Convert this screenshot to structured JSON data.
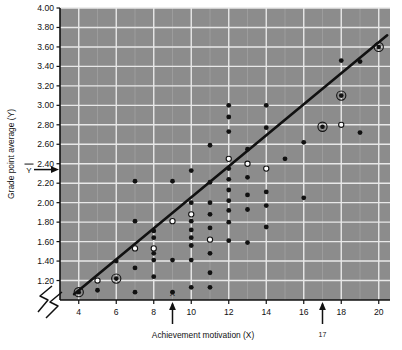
{
  "figure": {
    "plot_bg_color": "#8c8c8c",
    "grid_color": "#e8e8e8",
    "point_color": "#111111",
    "line_color": "#111111",
    "axis_color": "#111111"
  },
  "chart_data": {
    "type": "scatter",
    "title": "",
    "xlabel": "Achievement motivation (X)",
    "ylabel": "Grade point average (Y)",
    "xlim": [
      3,
      20.6
    ],
    "ylim": [
      1.0,
      4.0
    ],
    "grid": true,
    "legend": "none",
    "x_ticks": [
      4,
      6,
      8,
      10,
      12,
      14,
      16,
      18,
      20
    ],
    "x_tick_labels": [
      "4",
      "6",
      "8",
      "10",
      "12",
      "14",
      "16",
      "18",
      "20"
    ],
    "y_ticks": [
      1.2,
      1.4,
      1.6,
      1.8,
      2.0,
      2.2,
      2.4,
      2.6,
      2.8,
      3.0,
      3.2,
      3.4,
      3.6,
      3.8,
      4.0
    ],
    "y_tick_labels": [
      "1.20",
      "1.40",
      "1.60",
      "1.80",
      "2.00",
      "2.20",
      "2.40",
      "2.60",
      "2.80",
      "3.00",
      "3.20",
      "3.40",
      "3.60",
      "3.80",
      "4.00"
    ],
    "annotations": {
      "x_mean_label": "X",
      "x_mean_value": 9,
      "y_mean_label": "Y",
      "y_mean_value": 2.34,
      "extra_tick_label": "17",
      "extra_tick_value": 17,
      "axis_break": "zigzag"
    },
    "regression_line": {
      "x_start": 3.75,
      "y_start": 1.06,
      "x_end": 20.45,
      "y_end": 3.72
    },
    "points": [
      {
        "x": 4.0,
        "y": 1.08,
        "marker": "circled"
      },
      {
        "x": 5.0,
        "y": 1.1,
        "marker": "filled"
      },
      {
        "x": 5.0,
        "y": 1.2,
        "marker": "open"
      },
      {
        "x": 6.0,
        "y": 1.22,
        "marker": "circled"
      },
      {
        "x": 6.0,
        "y": 1.4,
        "marker": "filled"
      },
      {
        "x": 7.0,
        "y": 1.08,
        "marker": "filled"
      },
      {
        "x": 7.0,
        "y": 1.33,
        "marker": "filled"
      },
      {
        "x": 7.0,
        "y": 1.53,
        "marker": "open"
      },
      {
        "x": 7.0,
        "y": 1.81,
        "marker": "filled"
      },
      {
        "x": 7.0,
        "y": 2.22,
        "marker": "filled"
      },
      {
        "x": 8.0,
        "y": 1.24,
        "marker": "filled"
      },
      {
        "x": 8.0,
        "y": 1.41,
        "marker": "filled"
      },
      {
        "x": 8.0,
        "y": 1.48,
        "marker": "filled"
      },
      {
        "x": 8.0,
        "y": 1.53,
        "marker": "open"
      },
      {
        "x": 8.0,
        "y": 1.64,
        "marker": "filled"
      },
      {
        "x": 8.0,
        "y": 1.71,
        "marker": "filled"
      },
      {
        "x": 9.0,
        "y": 1.08,
        "marker": "filled"
      },
      {
        "x": 9.0,
        "y": 1.41,
        "marker": "filled"
      },
      {
        "x": 9.0,
        "y": 1.81,
        "marker": "open"
      },
      {
        "x": 9.0,
        "y": 2.22,
        "marker": "filled"
      },
      {
        "x": 10.0,
        "y": 1.13,
        "marker": "filled"
      },
      {
        "x": 10.0,
        "y": 1.41,
        "marker": "filled"
      },
      {
        "x": 10.0,
        "y": 1.56,
        "marker": "filled"
      },
      {
        "x": 10.0,
        "y": 1.64,
        "marker": "filled"
      },
      {
        "x": 10.0,
        "y": 1.72,
        "marker": "filled"
      },
      {
        "x": 10.0,
        "y": 1.81,
        "marker": "filled"
      },
      {
        "x": 10.0,
        "y": 1.88,
        "marker": "open"
      },
      {
        "x": 10.0,
        "y": 2.0,
        "marker": "filled"
      },
      {
        "x": 10.0,
        "y": 2.33,
        "marker": "filled"
      },
      {
        "x": 11.0,
        "y": 1.13,
        "marker": "filled"
      },
      {
        "x": 11.0,
        "y": 1.28,
        "marker": "filled"
      },
      {
        "x": 11.0,
        "y": 1.48,
        "marker": "filled"
      },
      {
        "x": 11.0,
        "y": 1.62,
        "marker": "open"
      },
      {
        "x": 11.0,
        "y": 1.74,
        "marker": "filled"
      },
      {
        "x": 11.0,
        "y": 1.88,
        "marker": "filled"
      },
      {
        "x": 11.0,
        "y": 2.0,
        "marker": "filled"
      },
      {
        "x": 11.0,
        "y": 2.21,
        "marker": "filled"
      },
      {
        "x": 11.0,
        "y": 2.59,
        "marker": "filled"
      },
      {
        "x": 12.0,
        "y": 1.61,
        "marker": "filled"
      },
      {
        "x": 12.0,
        "y": 1.8,
        "marker": "filled"
      },
      {
        "x": 12.0,
        "y": 1.92,
        "marker": "filled"
      },
      {
        "x": 12.0,
        "y": 2.02,
        "marker": "filled"
      },
      {
        "x": 12.0,
        "y": 2.13,
        "marker": "filled"
      },
      {
        "x": 12.0,
        "y": 2.24,
        "marker": "filled"
      },
      {
        "x": 12.0,
        "y": 2.35,
        "marker": "filled"
      },
      {
        "x": 12.0,
        "y": 2.45,
        "marker": "open"
      },
      {
        "x": 12.0,
        "y": 2.73,
        "marker": "filled"
      },
      {
        "x": 12.0,
        "y": 2.88,
        "marker": "filled"
      },
      {
        "x": 12.0,
        "y": 3.0,
        "marker": "filled"
      },
      {
        "x": 13.0,
        "y": 1.59,
        "marker": "filled"
      },
      {
        "x": 13.0,
        "y": 1.93,
        "marker": "filled"
      },
      {
        "x": 13.0,
        "y": 2.08,
        "marker": "filled"
      },
      {
        "x": 13.0,
        "y": 2.26,
        "marker": "filled"
      },
      {
        "x": 13.0,
        "y": 2.4,
        "marker": "open"
      },
      {
        "x": 13.0,
        "y": 2.55,
        "marker": "filled"
      },
      {
        "x": 14.0,
        "y": 1.75,
        "marker": "filled"
      },
      {
        "x": 14.0,
        "y": 1.97,
        "marker": "filled"
      },
      {
        "x": 14.0,
        "y": 2.11,
        "marker": "filled"
      },
      {
        "x": 14.0,
        "y": 2.35,
        "marker": "open"
      },
      {
        "x": 14.0,
        "y": 2.77,
        "marker": "filled"
      },
      {
        "x": 14.0,
        "y": 3.0,
        "marker": "filled"
      },
      {
        "x": 15.0,
        "y": 2.45,
        "marker": "filled"
      },
      {
        "x": 16.0,
        "y": 2.05,
        "marker": "filled"
      },
      {
        "x": 16.0,
        "y": 2.62,
        "marker": "filled"
      },
      {
        "x": 17.0,
        "y": 2.78,
        "marker": "circled"
      },
      {
        "x": 18.0,
        "y": 2.8,
        "marker": "open"
      },
      {
        "x": 18.0,
        "y": 3.1,
        "marker": "circled"
      },
      {
        "x": 18.0,
        "y": 3.46,
        "marker": "filled"
      },
      {
        "x": 19.0,
        "y": 2.72,
        "marker": "filled"
      },
      {
        "x": 19.0,
        "y": 3.45,
        "marker": "filled"
      },
      {
        "x": 20.0,
        "y": 3.6,
        "marker": "circled"
      }
    ]
  }
}
